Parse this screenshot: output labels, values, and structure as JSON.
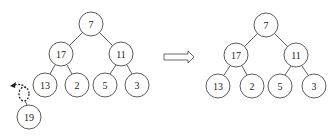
{
  "left_tree": {
    "nodes": [
      {
        "id": "n7",
        "label": "7",
        "cx": 91,
        "cy": 24
      },
      {
        "id": "n17",
        "label": "17",
        "cx": 61,
        "cy": 54
      },
      {
        "id": "n11",
        "label": "11",
        "cx": 121,
        "cy": 54
      },
      {
        "id": "n13",
        "label": "13",
        "cx": 45,
        "cy": 85
      },
      {
        "id": "n2",
        "label": "2",
        "cx": 77,
        "cy": 85
      },
      {
        "id": "n5",
        "label": "5",
        "cx": 105,
        "cy": 85
      },
      {
        "id": "n3",
        "label": "3",
        "cx": 137,
        "cy": 85
      },
      {
        "id": "n19",
        "label": "19",
        "cx": 29,
        "cy": 117
      }
    ],
    "removed_node_note": "19 detached; dashed placeholder with curved arrow"
  },
  "transform_arrow": {
    "direction": "right"
  },
  "right_tree": {
    "nodes": [
      {
        "id": "m7",
        "label": "7",
        "cx": 266,
        "cy": 25
      },
      {
        "id": "m17",
        "label": "17",
        "cx": 236,
        "cy": 55
      },
      {
        "id": "m11",
        "label": "11",
        "cx": 296,
        "cy": 55
      },
      {
        "id": "m13",
        "label": "13",
        "cx": 218,
        "cy": 86
      },
      {
        "id": "m2",
        "label": "2",
        "cx": 252,
        "cy": 86
      },
      {
        "id": "m5",
        "label": "5",
        "cx": 280,
        "cy": 86
      },
      {
        "id": "m3",
        "label": "3",
        "cx": 314,
        "cy": 86
      }
    ]
  },
  "labels": {
    "l7": "7",
    "l17": "17",
    "l11": "11",
    "l13": "13",
    "l2": "2",
    "l5": "5",
    "l3": "3",
    "l19": "19",
    "r7": "7",
    "r17": "17",
    "r11": "11",
    "r13": "13",
    "r2": "2",
    "r5": "5",
    "r3": "3"
  }
}
